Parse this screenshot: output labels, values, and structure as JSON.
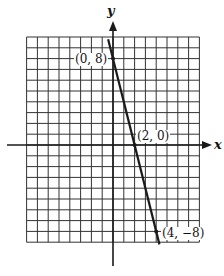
{
  "chart_data": {
    "type": "line",
    "title": "",
    "xlabel": "x",
    "ylabel": "y",
    "xlim": [
      -8,
      8
    ],
    "ylim": [
      -9,
      10
    ],
    "grid": true,
    "grid_unit": 1,
    "series": [
      {
        "name": "line",
        "x": [
          0,
          2,
          4
        ],
        "y": [
          8,
          0,
          -8
        ],
        "equation": "y = -4x + 8"
      }
    ],
    "points": [
      {
        "x": 0,
        "y": 8,
        "label": "(0, 8)"
      },
      {
        "x": 2,
        "y": 0,
        "label": "(2, 0)"
      },
      {
        "x": 4,
        "y": -8,
        "label": "(4, -8)"
      }
    ]
  },
  "labels": {
    "x_axis": "x",
    "y_axis": "y",
    "p1": "(0, 8)",
    "p2": "(2, 0)",
    "p3": "(4, −8)"
  },
  "colors": {
    "ink": "#1a1a1a",
    "grid": "#333333"
  }
}
